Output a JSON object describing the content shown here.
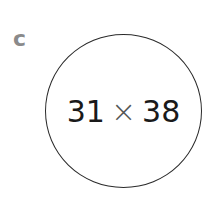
{
  "label": "c",
  "expression": {
    "left": "31",
    "operator": "×",
    "right": "38"
  }
}
